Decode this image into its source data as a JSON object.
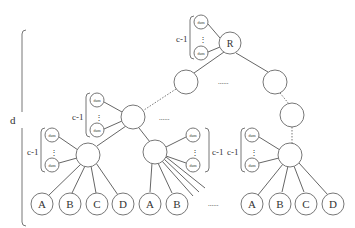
{
  "diagram": {
    "depth_label": "d",
    "root_label": "R",
    "dummy_label": "dum",
    "count_label": "c-1",
    "vdots": "⋮",
    "ellipsis": "......",
    "leaves": {
      "group1": [
        "A",
        "B",
        "C",
        "D"
      ],
      "group2": [
        "A",
        "B"
      ],
      "group3": [
        "A",
        "B",
        "C",
        "D"
      ]
    }
  }
}
